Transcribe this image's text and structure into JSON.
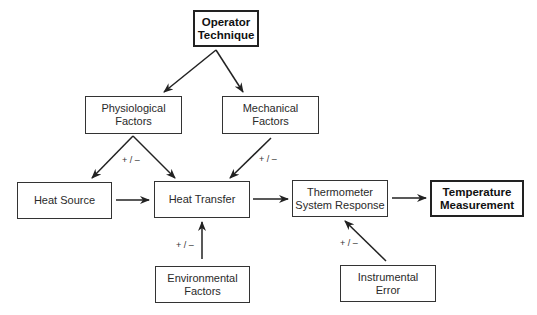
{
  "diagram": {
    "nodes": {
      "operator": {
        "line1": "Operator",
        "line2": "Technique"
      },
      "physiological": {
        "line1": "Physiological",
        "line2": "Factors"
      },
      "mechanical": {
        "line1": "Mechanical",
        "line2": "Factors"
      },
      "heat_source": {
        "line1": "Heat Source"
      },
      "heat_transfer": {
        "line1": "Heat Transfer"
      },
      "thermometer": {
        "line1": "Thermometer",
        "line2": "System Response"
      },
      "measurement": {
        "line1": "Temperature",
        "line2": "Measurement"
      },
      "environmental": {
        "line1": "Environmental",
        "line2": "Factors"
      },
      "instrumental": {
        "line1": "Instrumental",
        "line2": "Error"
      }
    },
    "edge_labels": {
      "physiological": "+ / –",
      "mechanical": "+ / –",
      "environmental": "+ / –",
      "instrumental": "+ / –"
    },
    "edges": [
      {
        "from": "Operator Technique",
        "to": "Physiological Factors"
      },
      {
        "from": "Operator Technique",
        "to": "Mechanical Factors"
      },
      {
        "from": "Physiological Factors",
        "to": "Heat Source"
      },
      {
        "from": "Physiological Factors",
        "to": "Heat Transfer"
      },
      {
        "from": "Mechanical Factors",
        "to": "Heat Transfer"
      },
      {
        "from": "Heat Source",
        "to": "Heat Transfer"
      },
      {
        "from": "Heat Transfer",
        "to": "Thermometer System Response"
      },
      {
        "from": "Thermometer System Response",
        "to": "Temperature Measurement"
      },
      {
        "from": "Environmental Factors",
        "to": "Heat Transfer"
      },
      {
        "from": "Instrumental Error",
        "to": "Thermometer System Response"
      }
    ]
  }
}
